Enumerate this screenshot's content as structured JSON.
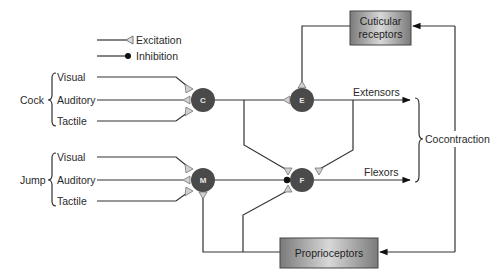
{
  "legend": {
    "excitation_label": "Excitation",
    "inhibition_label": "Inhibition"
  },
  "groups": {
    "cock": {
      "label": "Cock",
      "inputs": [
        "Visual",
        "Auditory",
        "Tactile"
      ]
    },
    "jump": {
      "label": "Jump",
      "inputs": [
        "Visual",
        "Auditory",
        "Tactile"
      ]
    }
  },
  "neurons": {
    "c": "C",
    "e": "E",
    "m": "M",
    "f": "F"
  },
  "outputs": {
    "extensors": "Extensors",
    "flexors": "Flexors",
    "cocontraction": "Cocontraction"
  },
  "boxes": {
    "cuticular_line1": "Cuticular",
    "cuticular_line2": "receptors",
    "proprioceptors": "Proprioceptors"
  },
  "colors": {
    "neuron_fill": "#4a4a4a",
    "synapse_excitation_fill": "#c8c8c8",
    "box_fill_light": "#d4d4d4",
    "box_fill_dark": "#7a7a7a",
    "wire": "#333333"
  }
}
